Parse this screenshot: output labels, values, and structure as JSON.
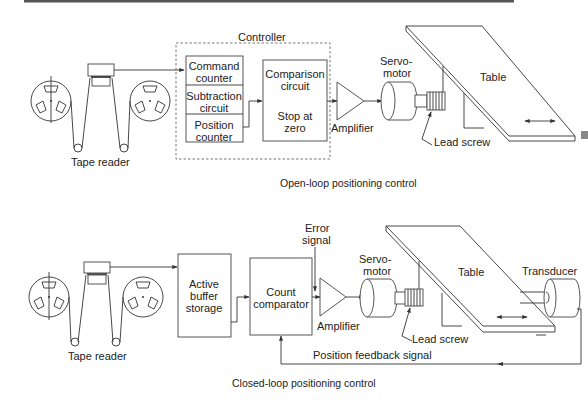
{
  "top_rule": {
    "color": "#555555"
  },
  "open_loop": {
    "caption": "Open-loop positioning control",
    "tape_reader": {
      "label": "Tape reader"
    },
    "controller": {
      "label": "Controller",
      "stack": [
        "Command",
        "counter",
        "Subtraction",
        "circuit",
        "Position",
        "counter"
      ],
      "comparison": [
        "Comparison",
        "circuit",
        "Stop at",
        "zero"
      ],
      "amplifier": "Amplifier"
    },
    "servo": [
      "Servo-",
      "motor"
    ],
    "table": "Table",
    "lead_screw": "Lead screw"
  },
  "closed_loop": {
    "caption": "Closed-loop positioning control",
    "tape_reader": {
      "label": "Tape reader"
    },
    "buffer": [
      "Active",
      "buffer",
      "storage"
    ],
    "comparator": [
      "Count",
      "comparator"
    ],
    "error_signal": [
      "Error",
      "signal"
    ],
    "amplifier": "Amplifier",
    "servo": [
      "Servo-",
      "motor"
    ],
    "table": "Table",
    "transducer": "Transducer",
    "lead_screw": "Lead screw",
    "feedback": "Position feedback signal"
  }
}
